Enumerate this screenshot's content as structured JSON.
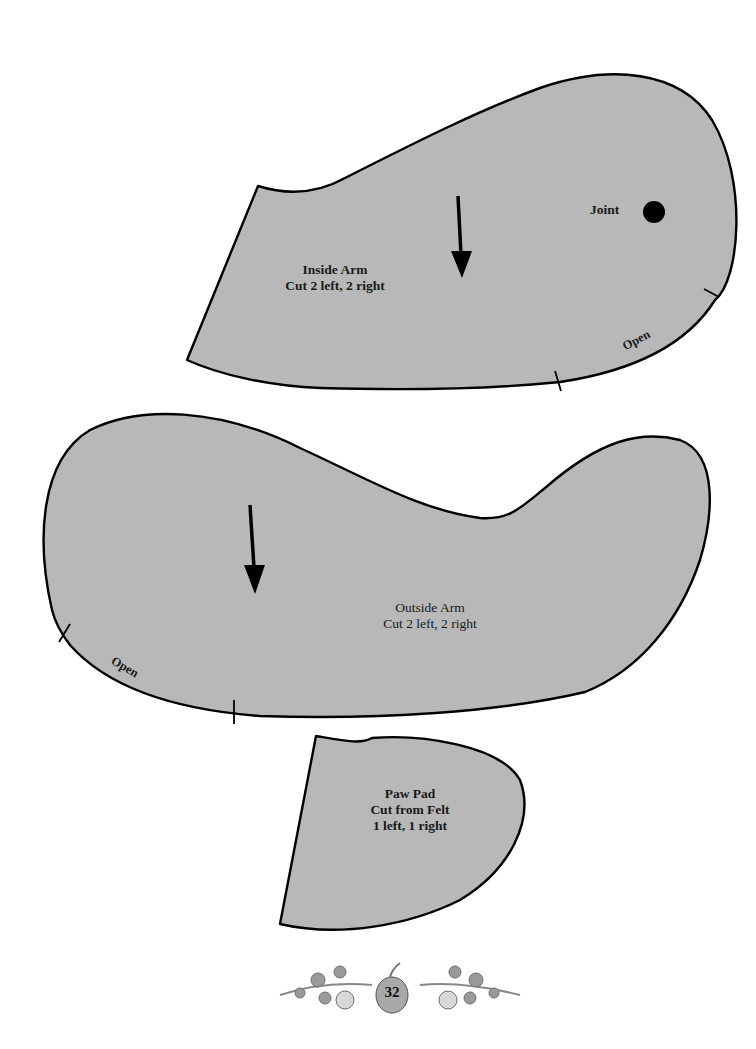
{
  "pieces": {
    "inside_arm": {
      "name": "Inside Arm",
      "instruction": "Cut 2 left, 2 right",
      "joint_label": "Joint",
      "open_label": "Open"
    },
    "outside_arm": {
      "name": "Outside Arm",
      "instruction": "Cut 2 left, 2 right",
      "open_label": "Open"
    },
    "paw_pad": {
      "name": "Paw Pad",
      "instruction_line1": "Cut from Felt",
      "instruction_line2": "1 left, 1 right"
    }
  },
  "footer": {
    "page_number": "32",
    "ornament": "floral-vine-ornament"
  },
  "colors": {
    "piece_fill": "#b8b8b8",
    "outline": "#000000",
    "background": "#ffffff"
  }
}
